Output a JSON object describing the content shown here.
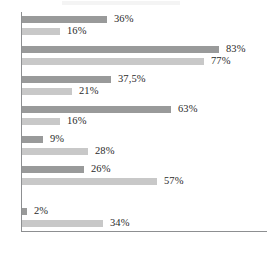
{
  "chart_data": {
    "type": "bar",
    "orientation": "horizontal",
    "title": "",
    "subtitle": "",
    "xlabel": "",
    "ylabel": "",
    "xlim": [
      0,
      100
    ],
    "grid": false,
    "legend": null,
    "value_suffix": "%",
    "decimal_separator": ",",
    "categories": [
      "1",
      "2",
      "3",
      "4",
      "5",
      "6",
      "7"
    ],
    "series": [
      {
        "name": "Series A",
        "color": "#999a9a",
        "values": [
          36,
          83,
          37.5,
          63,
          9,
          26,
          2
        ],
        "labels": [
          "36%",
          "83%",
          "37,5%",
          "63%",
          "9%",
          "26%",
          "2%"
        ]
      },
      {
        "name": "Series B",
        "color": "#c8c8c8",
        "values": [
          16,
          77,
          21,
          16,
          28,
          57,
          34
        ],
        "labels": [
          "16%",
          "77%",
          "21%",
          "16%",
          "28%",
          "57%",
          "34%"
        ]
      }
    ],
    "groups": [
      {
        "top": 4,
        "bars": [
          {
            "series": 0,
            "label": "36%",
            "value": 36,
            "top": 0
          },
          {
            "series": 1,
            "label": "16%",
            "value": 16,
            "top": 12
          }
        ]
      },
      {
        "top": 34,
        "bars": [
          {
            "series": 0,
            "label": "83%",
            "value": 83,
            "top": 0
          },
          {
            "series": 1,
            "label": "77%",
            "value": 77,
            "top": 12
          }
        ]
      },
      {
        "top": 64,
        "bars": [
          {
            "series": 0,
            "label": "37,5%",
            "value": 37.5,
            "top": 0
          },
          {
            "series": 1,
            "label": "21%",
            "value": 21,
            "top": 12
          }
        ]
      },
      {
        "top": 94,
        "bars": [
          {
            "series": 0,
            "label": "63%",
            "value": 63,
            "top": 0
          },
          {
            "series": 1,
            "label": "16%",
            "value": 16,
            "top": 12
          }
        ]
      },
      {
        "top": 124,
        "bars": [
          {
            "series": 0,
            "label": "9%",
            "value": 9,
            "top": 0
          },
          {
            "series": 1,
            "label": "28%",
            "value": 28,
            "top": 12
          }
        ]
      },
      {
        "top": 154,
        "bars": [
          {
            "series": 0,
            "label": "26%",
            "value": 26,
            "top": 0
          },
          {
            "series": 1,
            "label": "57%",
            "value": 57,
            "top": 12
          }
        ]
      },
      {
        "top": 196,
        "bars": [
          {
            "series": 0,
            "label": "2%",
            "value": 2,
            "top": 0
          },
          {
            "series": 1,
            "label": "34%",
            "value": 34,
            "top": 12
          }
        ]
      }
    ],
    "pixels_per_percent": 2.37,
    "colors": {
      "series_a": "#999a9a",
      "series_b": "#c8c8c8",
      "axis": "#8d8f91",
      "label_text": "#2a2a2a",
      "background": "#ffffff"
    }
  }
}
